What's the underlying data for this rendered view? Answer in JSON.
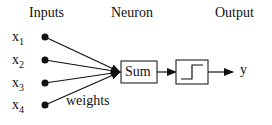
{
  "diagram": {
    "headers": {
      "inputs": "Inputs",
      "neuron": "Neuron",
      "output": "Output"
    },
    "inputs": [
      {
        "var": "x",
        "sub": "1"
      },
      {
        "var": "x",
        "sub": "2"
      },
      {
        "var": "x",
        "sub": "3"
      },
      {
        "var": "x",
        "sub": "4"
      }
    ],
    "weights_label": "weights",
    "sum_label": "Sum",
    "activation": "step-function",
    "output_label": "y",
    "colors": {
      "stroke": "#111111",
      "background": "#ffffff"
    }
  }
}
